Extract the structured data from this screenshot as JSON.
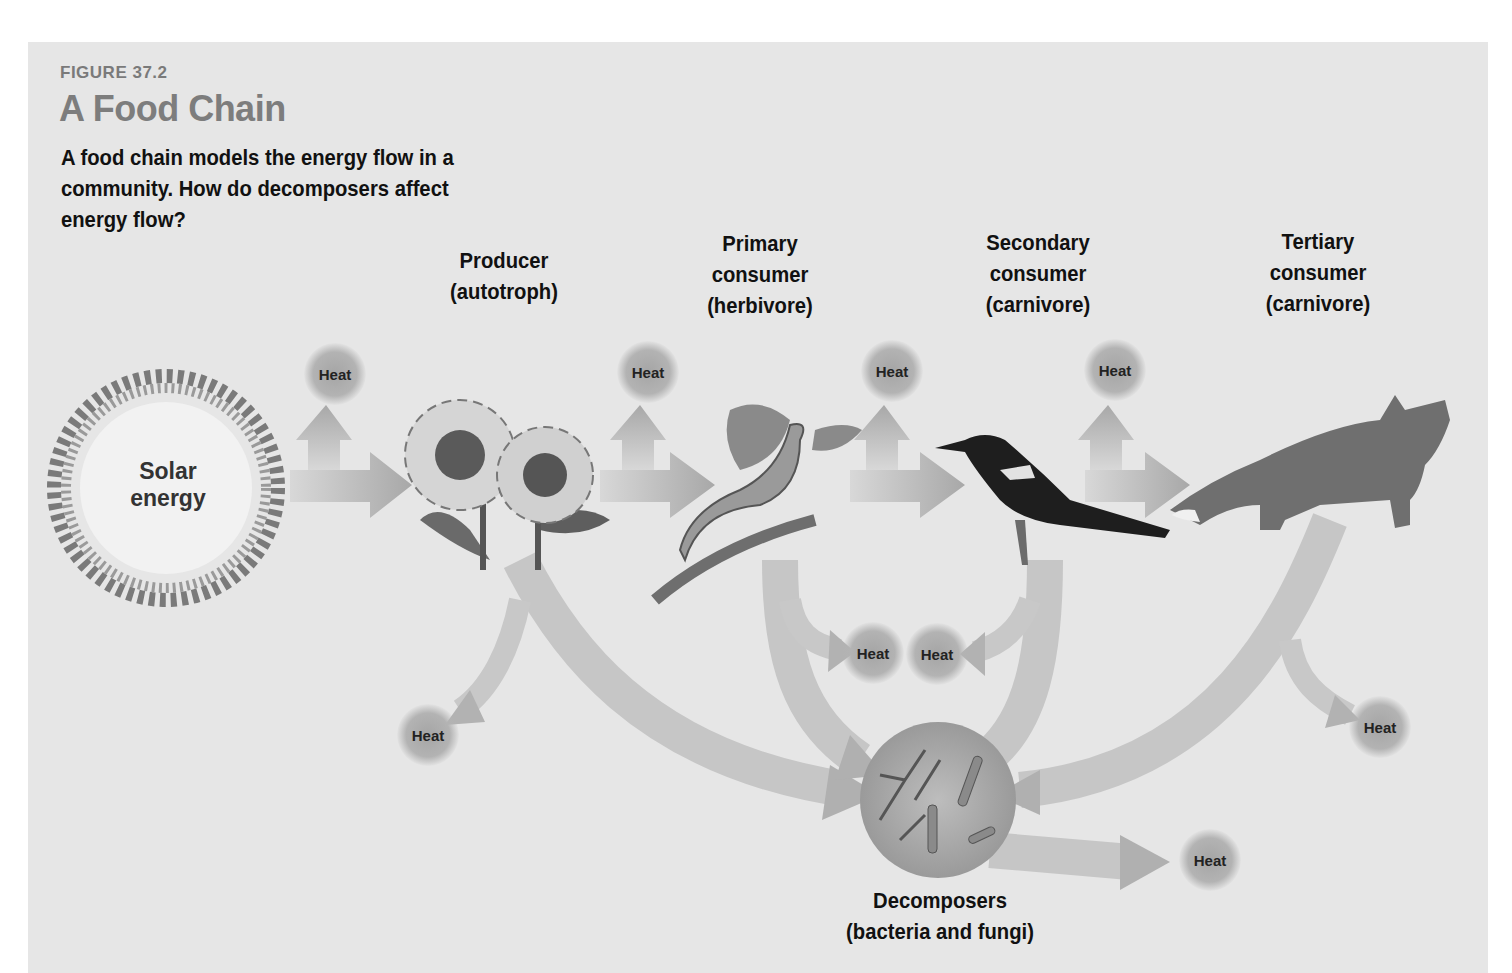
{
  "figure": {
    "number": "FIGURE 37.2",
    "title": "A Food Chain",
    "caption": "A food chain models the energy flow in a community. How do decomposers affect energy flow?"
  },
  "colors": {
    "panel_bg": "#e6e6e6",
    "title_gray": "#7d7d7d",
    "arrow_gray": "#b4b4b4",
    "heat_gray": "#a8a8a8"
  },
  "sun": {
    "line1": "Solar",
    "line2": "energy",
    "icon": "sun-icon"
  },
  "levels": [
    {
      "id": "producer",
      "line1": "Producer",
      "line2": "(autotroph)",
      "line3": "",
      "organism": "sunflower-icon"
    },
    {
      "id": "primary",
      "line1": "Primary",
      "line2": "consumer",
      "line3": "(herbivore)",
      "organism": "caterpillar-icon"
    },
    {
      "id": "secondary",
      "line1": "Secondary",
      "line2": "consumer",
      "line3": "(carnivore)",
      "organism": "bird-icon"
    },
    {
      "id": "tertiary",
      "line1": "Tertiary",
      "line2": "consumer",
      "line3": "(carnivore)",
      "organism": "fox-icon"
    }
  ],
  "decomposers": {
    "line1": "Decomposers",
    "line2": "(bacteria and fungi)",
    "organism": "microbe-icon"
  },
  "heat_label": "Heat",
  "heat_nodes": [
    {
      "label": "Heat",
      "x": 335,
      "y": 374
    },
    {
      "label": "Heat",
      "x": 648,
      "y": 372
    },
    {
      "label": "Heat",
      "x": 892,
      "y": 371
    },
    {
      "label": "Heat",
      "x": 1115,
      "y": 370
    },
    {
      "label": "Heat",
      "x": 873,
      "y": 653
    },
    {
      "label": "Heat",
      "x": 937,
      "y": 654
    },
    {
      "label": "Heat",
      "x": 428,
      "y": 735
    },
    {
      "label": "Heat",
      "x": 1380,
      "y": 727
    },
    {
      "label": "Heat",
      "x": 1210,
      "y": 860
    }
  ]
}
